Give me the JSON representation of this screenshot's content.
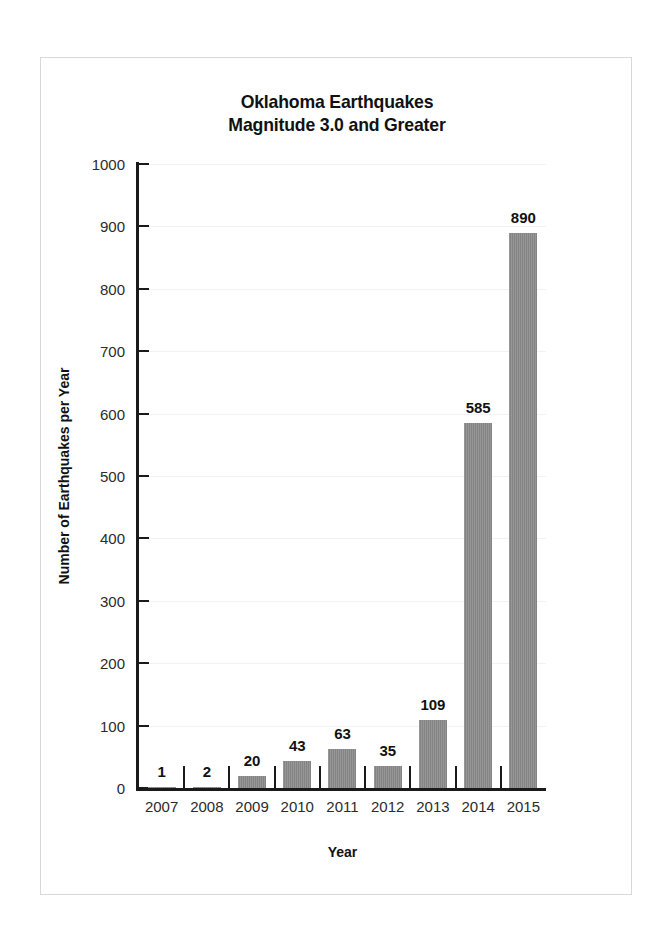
{
  "chart_data": {
    "type": "bar",
    "title": "Oklahoma Earthquakes Magnitude 3.0 and Greater",
    "title_lines": [
      "Oklahoma Earthquakes",
      "Magnitude 3.0 and Greater"
    ],
    "xlabel": "Year",
    "ylabel": "Number of Earthquakes per Year",
    "categories": [
      "2007",
      "2008",
      "2009",
      "2010",
      "2011",
      "2012",
      "2013",
      "2014",
      "2015"
    ],
    "values": [
      1,
      2,
      20,
      43,
      63,
      35,
      109,
      585,
      890
    ],
    "value_labels": [
      "1",
      "2",
      "20",
      "43",
      "63",
      "35",
      "109",
      "585",
      "890"
    ],
    "ylim": [
      0,
      1000
    ],
    "ytick_step": 100,
    "ytick_labels": [
      "0",
      "100",
      "200",
      "300",
      "400",
      "500",
      "600",
      "700",
      "800",
      "900",
      "1000"
    ],
    "ytick_values": [
      0,
      100,
      200,
      300,
      400,
      500,
      600,
      700,
      800,
      900,
      1000
    ],
    "grid": true,
    "legend": false,
    "bar_color": "#8a8a8a",
    "axis_color": "#1a1a1a",
    "grid_color": "#f2f2f2",
    "frame_color": "#d8d8d8",
    "background_color": "#ffffff"
  }
}
